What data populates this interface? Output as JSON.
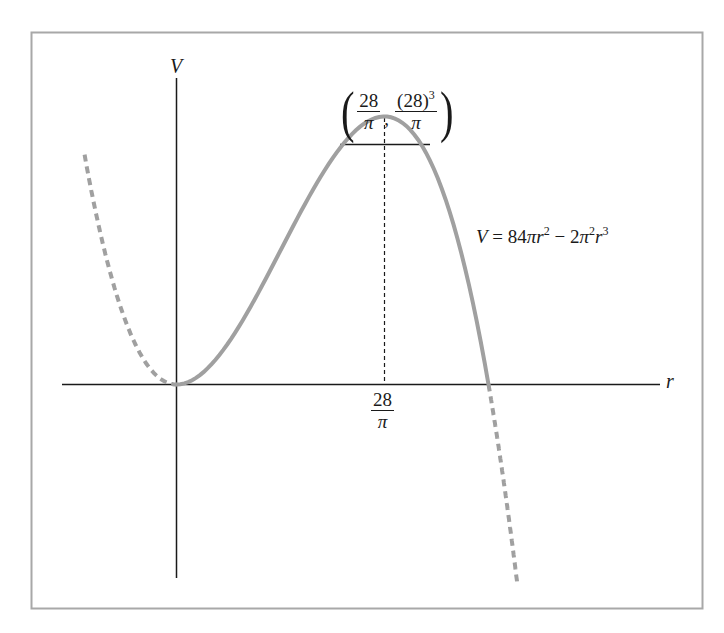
{
  "chart_data": {
    "type": "line",
    "title": "",
    "xlabel": "r",
    "ylabel": "V",
    "equation": "V = 84πr² − 2π²r³",
    "equation_parts": {
      "lhs": "V",
      "eq": "=",
      "t1_coef": "84",
      "t1_pi": "π",
      "t1_var": "r",
      "t1_exp": "2",
      "minus": "−",
      "t2_coef": "2",
      "t2_pi": "π",
      "t2_pi_exp": "2",
      "t2_var": "r",
      "t2_exp": "3"
    },
    "grid": false,
    "legend": null,
    "x_tick_labels": [
      {
        "num": "28",
        "den": "π",
        "value": 8.9127
      }
    ],
    "annotations": [
      {
        "type": "point",
        "label": "(28/π, (28)³/π)",
        "x_num": "28",
        "x_den": "π",
        "y_num": "(28)",
        "y_num_exp": "3",
        "y_den": "π",
        "x": 8.9127,
        "y": 6987.6
      },
      {
        "type": "dashed-vertical",
        "x": 8.9127,
        "from_y": 0,
        "to_y": 6987.6
      }
    ],
    "series": [
      {
        "name": "V = 84πr² − 2π²r³",
        "style": "solid",
        "color": "#9e9e9e",
        "domain": [
          0,
          13.369
        ],
        "x": [
          0,
          2,
          4,
          6,
          8,
          8.9127,
          10,
          12,
          13.369
        ],
        "y": [
          0,
          557,
          1915,
          3434,
          6364,
          6987.6,
          6596,
          3553,
          0
        ]
      },
      {
        "name": "left extension",
        "style": "dashed",
        "color": "#9e9e9e",
        "domain": [
          -3.94,
          0
        ]
      },
      {
        "name": "right extension",
        "style": "dashed",
        "color": "#9e9e9e",
        "domain": [
          13.369,
          14.6
        ]
      }
    ],
    "key_points": {
      "origin": [
        0,
        0
      ],
      "maximum": [
        8.9127,
        6987.6
      ],
      "root": [
        13.369,
        0
      ]
    },
    "colors": {
      "axis": "#1a1a1a",
      "curve": "#a0a0a0",
      "frame": "#a8a8a8"
    }
  },
  "labels": {
    "y_axis": "V",
    "x_axis": "r",
    "tick_num": "28",
    "tick_den": "π",
    "peak_x_num": "28",
    "peak_x_den": "π",
    "peak_y_num": "(28)",
    "peak_y_exp": "3",
    "peak_y_den": "π",
    "open_paren": "(",
    "close_paren": ")",
    "comma": ","
  }
}
